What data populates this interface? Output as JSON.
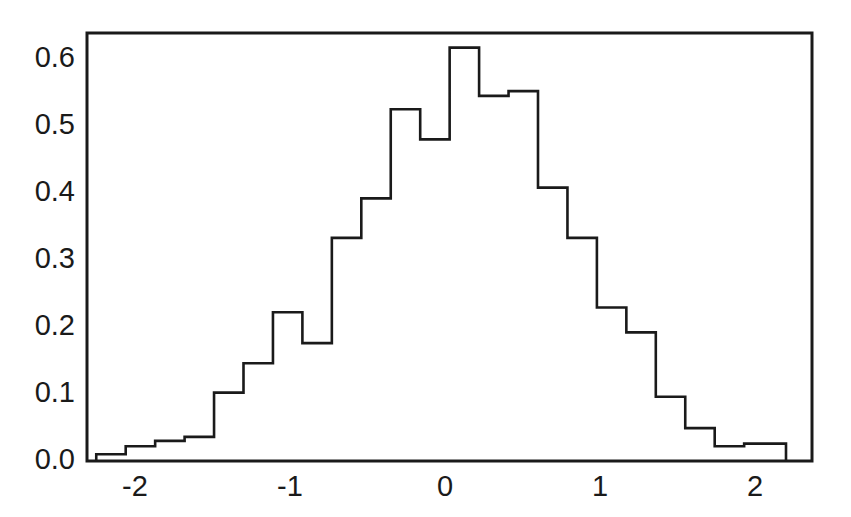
{
  "figure": {
    "background_color": "#ffffff",
    "line_color": "#1a1a1a",
    "text_color": "#1a1a1a"
  },
  "chart_data": {
    "type": "bar",
    "subtype": "histogram-step-outline",
    "title": "",
    "subtitle": "",
    "xlabel": "",
    "ylabel": "",
    "xlim": [
      -2.45,
      2.45
    ],
    "ylim": [
      0.0,
      0.655
    ],
    "grid": false,
    "legend": null,
    "legend_position": "none",
    "xticks": [
      -2,
      -1,
      0,
      1,
      2
    ],
    "xtick_labels": [
      "-2",
      "-1",
      "0",
      "1",
      "2"
    ],
    "yticks": [
      0.0,
      0.1,
      0.2,
      0.3,
      0.4,
      0.5,
      0.6
    ],
    "ytick_labels": [
      "0.0",
      "0.1",
      "0.2",
      "0.3",
      "0.4",
      "0.5",
      "0.6"
    ],
    "bin_width": 0.19,
    "bin_edges": [
      -2.25,
      -2.06,
      -1.87,
      -1.68,
      -1.49,
      -1.3,
      -1.11,
      -0.92,
      -0.73,
      -0.54,
      -0.35,
      -0.16,
      0.03,
      0.22,
      0.41,
      0.6,
      0.79,
      0.98,
      1.17,
      1.36,
      1.55,
      1.74,
      1.93,
      2.12,
      2.2
    ],
    "bin_centers": [
      -2.155,
      -1.965,
      -1.775,
      -1.585,
      -1.395,
      -1.205,
      -1.015,
      -0.825,
      -0.635,
      -0.445,
      -0.255,
      -0.065,
      0.125,
      0.315,
      0.505,
      0.695,
      0.885,
      1.075,
      1.265,
      1.455,
      1.645,
      1.835,
      2.025,
      2.16
    ],
    "categories": [
      "-2.16",
      "-1.97",
      "-1.78",
      "-1.59",
      "-1.40",
      "-1.21",
      "-1.02",
      "-0.83",
      "-0.64",
      "-0.45",
      "-0.26",
      "-0.07",
      "0.13",
      "0.32",
      "0.51",
      "0.70",
      "0.89",
      "1.08",
      "1.27",
      "1.46",
      "1.65",
      "1.84",
      "2.03",
      "2.16"
    ],
    "values": [
      0.01,
      0.022,
      0.03,
      0.036,
      0.102,
      0.146,
      0.222,
      0.176,
      0.333,
      0.392,
      0.525,
      0.48,
      0.617,
      0.545,
      0.552,
      0.408,
      0.333,
      0.229,
      0.192,
      0.096,
      0.049,
      0.022,
      0.026,
      0.026
    ],
    "ylabel_values_note": "probability density"
  }
}
